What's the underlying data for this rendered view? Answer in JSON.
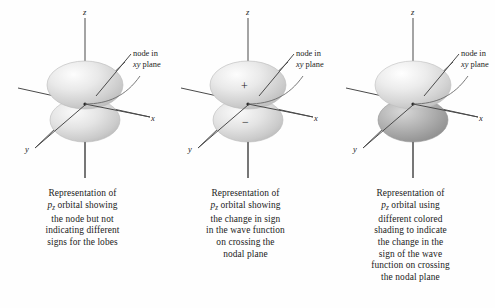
{
  "figure": {
    "kind": "orbital-diagram-triptych",
    "background_color": "#fefefe",
    "axis_color": "#4a4a4a",
    "text_color": "#1c1c1c"
  },
  "axes": {
    "z_label": "z",
    "x_label": "x",
    "y_label": "y"
  },
  "annotation": {
    "line1": "node in",
    "line2": "xy plane"
  },
  "panels": [
    {
      "id": "panel-1",
      "orbital_label": "p",
      "orbital_subscript": "z",
      "signs": [],
      "top_lobe_shading": "light-gray",
      "bottom_lobe_shading": "light-gray",
      "top_lobe_color": "#d9d9d9",
      "bottom_lobe_color": "#d9d9d9",
      "caption_lines": [
        "Representation of",
        "orbital showing",
        "the node but not",
        "indicating different",
        "signs for the lobes"
      ]
    },
    {
      "id": "panel-2",
      "orbital_label": "p",
      "orbital_subscript": "z",
      "signs": [
        "+",
        "−"
      ],
      "top_lobe_shading": "light-gray",
      "bottom_lobe_shading": "light-gray",
      "top_lobe_color": "#d9d9d9",
      "bottom_lobe_color": "#d9d9d9",
      "caption_lines": [
        "Representation of",
        "orbital showing",
        "the change in sign",
        "in the wave function",
        "on crossing the",
        "nodal plane"
      ]
    },
    {
      "id": "panel-3",
      "orbital_label": "p",
      "orbital_subscript": "z",
      "signs": [],
      "top_lobe_shading": "light-gray",
      "bottom_lobe_shading": "dark-gray",
      "top_lobe_color": "#dcdcdc",
      "bottom_lobe_color": "#a8a8a8",
      "caption_lines": [
        "Representation of",
        "orbital using",
        "different colored",
        "shading to indicate",
        "the change in the",
        "sign of the wave",
        "function on crossing",
        "the nodal plane"
      ]
    }
  ]
}
